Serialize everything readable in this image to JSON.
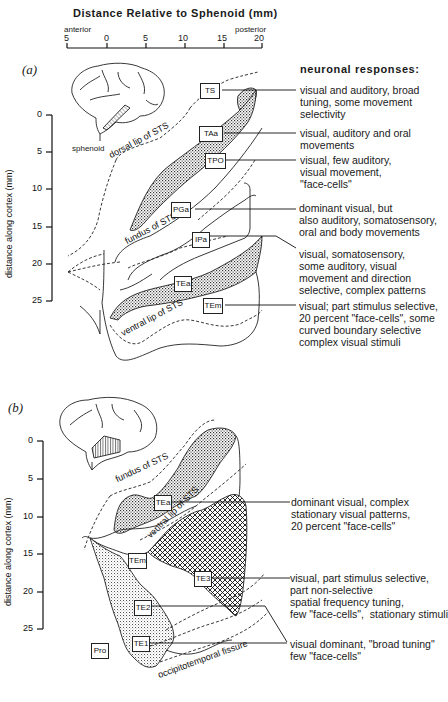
{
  "top_axis": {
    "title": "Distance Relative to Sphenoid (mm)",
    "left_label": "anterior",
    "right_label": "posterior",
    "ticks": [
      "5",
      "0",
      "5",
      "10",
      "15",
      "20"
    ]
  },
  "panel_a": {
    "label": "(a)",
    "header": "neuronal responses:",
    "inset_label": "sphenoid",
    "y_axis": {
      "label": "distance along cortex (mm)",
      "ticks": [
        "0",
        "5",
        "10",
        "15",
        "20",
        "25"
      ]
    },
    "landmarks": {
      "dorsal_lip": "dorsal lip of STS",
      "fundus": "fundus of STS",
      "ventral_lip": "ventral lip of STS"
    },
    "areas": [
      {
        "name": "TS",
        "response": "visual and auditory, broad\ntuning, some movement\nselectivity"
      },
      {
        "name": "TAa",
        "response": "visual, auditory and oral\nmovements"
      },
      {
        "name": "TPO",
        "response": "visual, few auditory,\nvisual movement,\n\"face-cells\""
      },
      {
        "name": "PGa",
        "response": "dominant visual, but\nalso auditory, somatosensory,\noral and body movements"
      },
      {
        "name": "IPa",
        "response": "visual, somatosensory,\nsome auditory, visual\nmovement and direction\nselective, complex patterns"
      },
      {
        "name": "TEa",
        "response": ""
      },
      {
        "name": "TEm",
        "response": "visual; part stimulus selective,\n20 percent \"face-cells\", some\ncurved boundary selective\ncomplex visual stimuli"
      }
    ]
  },
  "panel_b": {
    "label": "(b)",
    "y_axis": {
      "label": "distance along cortex (mm)",
      "ticks": [
        "0",
        "5",
        "10",
        "15",
        "20",
        "25"
      ]
    },
    "landmarks": {
      "fundus": "fundus of STS",
      "ventral_lip": "ventral lip of STS",
      "occipitotemporal": "occipitotemporal fissure"
    },
    "areas": [
      {
        "name": "TEa",
        "response": "dominant visual, complex\nstationary visual patterns,\n20 percent \"face-cells\""
      },
      {
        "name": "TEm",
        "response": ""
      },
      {
        "name": "TE3",
        "response": "visual, part stimulus selective,\npart non-selective\nspatial frequency tuning,\nfew \"face-cells\",  stationary stimuli"
      },
      {
        "name": "TE2",
        "response": ""
      },
      {
        "name": "TE1",
        "response": "visual dominant, \"broad tuning\"\nfew \"face-cells\""
      },
      {
        "name": "Pro",
        "response": ""
      }
    ]
  }
}
